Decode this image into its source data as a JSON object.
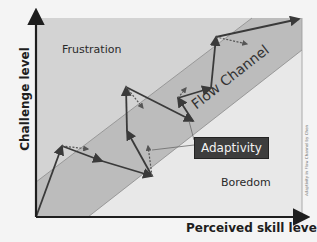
{
  "diagram": {
    "title": "Flow Channel Adaptivity",
    "axes": {
      "y_label": "Challenge level",
      "x_label": "Perceived skill level"
    },
    "regions": {
      "top_left": "Frustration",
      "middle_band": "Flow Channel",
      "bottom_right": "Boredom"
    },
    "callout": "Adaptivity",
    "credit": "Adaptivity in Flow Channel by Chen",
    "colors": {
      "frustration_fill": "#d3d3d3",
      "flow_fill": "#bcbcbc",
      "boredom_fill": "#e8e8e8",
      "path_stroke": "#3a3a3a",
      "callout_bg": "#3d3d3d",
      "callout_text": "#f2f2f2"
    },
    "path_points": [
      [
        36,
        217
      ],
      [
        62,
        146
      ],
      [
        102,
        161
      ],
      [
        152,
        176
      ],
      [
        127,
        131
      ],
      [
        126,
        87
      ],
      [
        193,
        121
      ],
      [
        178,
        98
      ],
      [
        211,
        88
      ],
      [
        216,
        37
      ],
      [
        299,
        19
      ]
    ],
    "adaptivity_arrows": [
      {
        "from": [
          62,
          146
        ],
        "to": [
          88,
          149
        ]
      },
      {
        "from": [
          152,
          176
        ],
        "to": [
          148,
          146
        ]
      },
      {
        "from": [
          126,
          87
        ],
        "to": [
          143,
          108
        ]
      },
      {
        "from": [
          178,
          98
        ],
        "to": [
          186,
          88
        ]
      },
      {
        "from": [
          216,
          37
        ],
        "to": [
          247,
          44
        ]
      }
    ]
  }
}
